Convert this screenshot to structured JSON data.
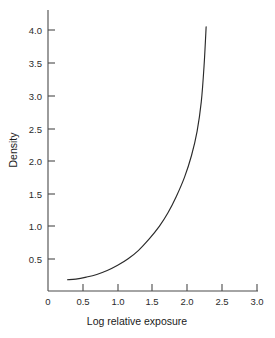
{
  "chart_data": {
    "type": "line",
    "title": "",
    "xlabel": "Log relative exposure",
    "ylabel": "Density",
    "xlim": [
      0,
      3.3
    ],
    "ylim": [
      0,
      4.3
    ],
    "grid": false,
    "legend": "none",
    "xticks": [
      0,
      0.5,
      1.0,
      1.5,
      2.0,
      2.5,
      3.0
    ],
    "xtick_labels": [
      "0",
      "0.5",
      "1.0",
      "1.5",
      "2.0",
      "2.5",
      "3.0"
    ],
    "yticks": [
      0.5,
      1.0,
      1.5,
      2.0,
      2.5,
      3.0,
      3.5,
      4.0
    ],
    "ytick_labels": [
      "0.5",
      "1.0",
      "1.5",
      "2.0",
      "2.5",
      "3.0",
      "3.5",
      "4.0"
    ],
    "series": [
      {
        "name": "characteristic curve",
        "x": [
          0.28,
          0.4,
          0.55,
          0.7,
          0.85,
          1.0,
          1.15,
          1.3,
          1.45,
          1.6,
          1.72,
          1.84,
          1.96,
          2.06,
          2.14,
          2.2,
          2.24,
          2.27
        ],
        "y": [
          0.18,
          0.19,
          0.22,
          0.26,
          0.32,
          0.4,
          0.5,
          0.63,
          0.8,
          1.0,
          1.2,
          1.45,
          1.75,
          2.08,
          2.45,
          2.9,
          3.45,
          4.05
        ]
      }
    ]
  },
  "axes": {
    "x_axis_label": "Log relative exposure",
    "y_axis_label": "Density"
  }
}
